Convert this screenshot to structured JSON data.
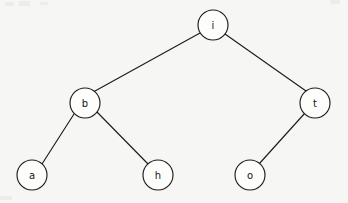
{
  "diagram": {
    "background_color": "#f6f6f4",
    "stroke_color": "#1d1d1d",
    "node_fill_color": "#fdfdfc",
    "node_radius": 15
  },
  "nodes": [
    {
      "id": "i",
      "label": "i",
      "cx": 213,
      "cy": 25,
      "level": 0,
      "role": "root"
    },
    {
      "id": "b",
      "label": "b",
      "cx": 85,
      "cy": 103,
      "level": 1,
      "role": "left-child"
    },
    {
      "id": "t",
      "label": "t",
      "cx": 315,
      "cy": 103,
      "level": 1,
      "role": "right-child"
    },
    {
      "id": "a",
      "label": "a",
      "cx": 32,
      "cy": 175,
      "level": 2,
      "role": "leaf"
    },
    {
      "id": "h",
      "label": "h",
      "cx": 158,
      "cy": 175,
      "level": 2,
      "role": "leaf"
    },
    {
      "id": "o",
      "label": "o",
      "cx": 250,
      "cy": 175,
      "level": 2,
      "role": "leaf"
    }
  ],
  "edges": [
    {
      "id": "i-b",
      "from": "i",
      "to": "b",
      "x1": 200,
      "y1": 33,
      "x2": 95,
      "y2": 91
    },
    {
      "id": "i-t",
      "from": "i",
      "to": "t",
      "x1": 225,
      "y1": 34,
      "x2": 306,
      "y2": 91
    },
    {
      "id": "b-a",
      "from": "b",
      "to": "a",
      "x1": 74,
      "y1": 114,
      "x2": 42,
      "y2": 164
    },
    {
      "id": "b-h",
      "from": "b",
      "to": "h",
      "x1": 97,
      "y1": 112,
      "x2": 149,
      "y2": 165
    },
    {
      "id": "t-o",
      "from": "t",
      "to": "o",
      "x1": 305,
      "y1": 113,
      "x2": 259,
      "y2": 164
    }
  ],
  "specks": [
    {
      "x": 5,
      "y": 2,
      "w": 9,
      "h": 4
    },
    {
      "x": 19,
      "y": 1,
      "w": 11,
      "h": 5
    },
    {
      "x": 40,
      "y": 2,
      "w": 8,
      "h": 3
    },
    {
      "x": 0,
      "y": 196,
      "w": 12,
      "h": 4
    },
    {
      "x": 330,
      "y": 0,
      "w": 10,
      "h": 4
    }
  ]
}
